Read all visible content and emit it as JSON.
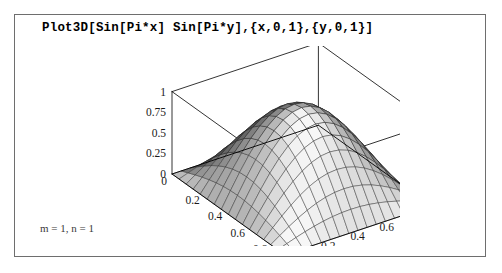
{
  "window": {
    "title": "Plot3D[Sin[Pi*x] Sin[Pi*y],{x,0,1},{y,0,1}]"
  },
  "input_cell": {
    "code": "Plot3D[Sin[Pi*x] Sin[Pi*y],{x,0,1},{y,0,1}]"
  },
  "caption": {
    "text": "m = 1, n = 1"
  },
  "colors": {
    "background": "#ffffff",
    "frame_border": "#6e6e6e",
    "axis_line": "#000000",
    "mesh_line": "#222222",
    "text": "#000000",
    "caption_text": "#3a3a3a",
    "surface_light": "#f2f2f2",
    "surface_dark": "#4a4a4a"
  },
  "chart_data": {
    "type": "surface",
    "title": "Plot3D[Sin[Pi*x] Sin[Pi*y],{x,0,1},{y,0,1}]",
    "function": "Sin[Pi*x] Sin[Pi*y]",
    "xlabel": "x",
    "ylabel": "y",
    "zlabel": "z",
    "xlim": [
      0,
      1
    ],
    "ylim": [
      0,
      1
    ],
    "zlim": [
      0,
      1
    ],
    "grid": false,
    "legend": "none",
    "mesh_n": 16,
    "x_ticks": [
      "0",
      "0.2",
      "0.4",
      "0.6",
      "0.8",
      "1"
    ],
    "x_tick_values": [
      0,
      0.2,
      0.4,
      0.6,
      0.8,
      1
    ],
    "y_ticks": [
      "0",
      "0.2",
      "0.4",
      "0.6",
      "0.8",
      "1"
    ],
    "y_tick_values": [
      0,
      0.2,
      0.4,
      0.6,
      0.8,
      1
    ],
    "z_ticks": [
      "0",
      "0.25",
      "0.5",
      "0.75",
      "1"
    ],
    "z_tick_values": [
      0,
      0.25,
      0.5,
      0.75,
      1
    ],
    "peak": {
      "x": 0.5,
      "y": 0.5,
      "z": 1
    },
    "view": {
      "azimuth": 35,
      "elevation": 26
    },
    "sample_points": [
      {
        "x": 0.0,
        "y": 0.0,
        "z": 0.0
      },
      {
        "x": 0.25,
        "y": 0.25,
        "z": 0.5
      },
      {
        "x": 0.5,
        "y": 0.25,
        "z": 0.707
      },
      {
        "x": 0.25,
        "y": 0.5,
        "z": 0.707
      },
      {
        "x": 0.5,
        "y": 0.5,
        "z": 1.0
      },
      {
        "x": 0.75,
        "y": 0.5,
        "z": 0.707
      },
      {
        "x": 0.5,
        "y": 0.75,
        "z": 0.707
      },
      {
        "x": 0.75,
        "y": 0.75,
        "z": 0.5
      },
      {
        "x": 1.0,
        "y": 1.0,
        "z": 0.0
      }
    ]
  }
}
